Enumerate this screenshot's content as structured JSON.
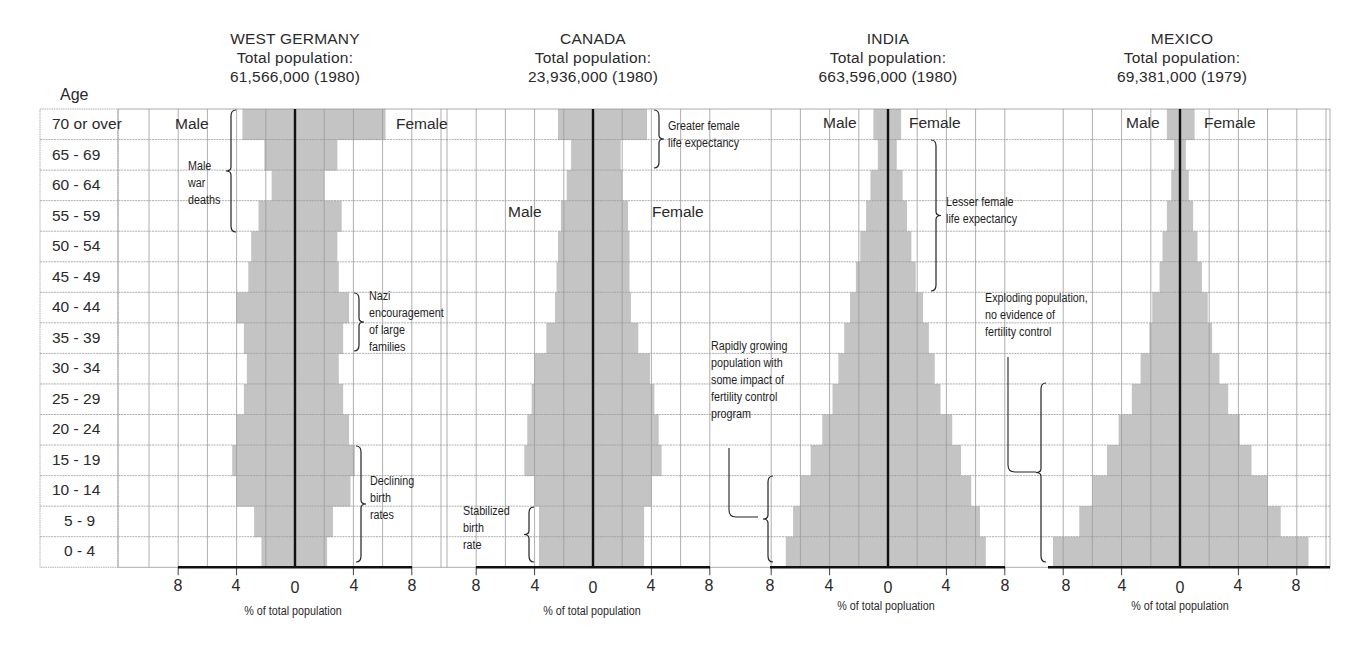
{
  "axis": {
    "age_header": "Age",
    "age_groups": [
      "70 or over",
      "65 - 69",
      "60 - 64",
      "55 - 59",
      "50 - 54",
      "45 - 49",
      "40 - 44",
      "35 - 39",
      "30 - 34",
      "25 - 29",
      "20 - 24",
      "15 - 19",
      "10 - 14",
      "5 - 9",
      "0 - 4"
    ],
    "tick_labels": [
      "8",
      "4",
      "0",
      "4",
      "8"
    ]
  },
  "panels": [
    {
      "country": "WEST GERMANY",
      "subtitle": "Total population:",
      "population": "61,566,000 (1980)",
      "xlabel": "% of total population",
      "male_label": "Male",
      "female_label": "Female",
      "annotations": [
        {
          "text": "Male\nwar\ndeaths"
        },
        {
          "text": "Nazi\nencouragement\nof large\nfamilies"
        },
        {
          "text": "Declining\nbirth\nrates"
        }
      ]
    },
    {
      "country": "CANADA",
      "subtitle": "Total population:",
      "population": "23,936,000 (1980)",
      "xlabel": "% of total population",
      "male_label": "Male",
      "female_label": "Female",
      "annotations": [
        {
          "text": "Greater female\nlife expectancy"
        },
        {
          "text": "Stabilized\nbirth\nrate"
        }
      ]
    },
    {
      "country": "INDIA",
      "subtitle": "Total population:",
      "population": "663,596,000 (1980)",
      "xlabel": "% of total popluation",
      "male_label": "Male",
      "female_label": "Female",
      "annotations": [
        {
          "text": "Lesser female\nlife expectancy"
        },
        {
          "text": "Rapidly growing\npopulation with\nsome impact of\nfertility control\nprogram"
        }
      ]
    },
    {
      "country": "MEXICO",
      "subtitle": "Total population:",
      "population": "69,381,000 (1979)",
      "xlabel": "% of total population",
      "male_label": "Male",
      "female_label": "Female",
      "annotations": [
        {
          "text": "Exploding population,\nno evidence of\nfertility control"
        }
      ]
    }
  ],
  "colors": {
    "bar": "#c4c4c4",
    "grid": "#9a9a9a",
    "axis": "#111111",
    "text": "#2a2a2a"
  },
  "chart_data": [
    {
      "type": "bar",
      "subtype": "population-pyramid",
      "title": "WEST GERMANY — Total population: 61,566,000 (1980)",
      "xlabel": "% of total population",
      "ylabel": "Age",
      "xlim": [
        -8,
        8
      ],
      "grid": true,
      "categories": [
        "70 or over",
        "65 - 69",
        "60 - 64",
        "55 - 59",
        "50 - 54",
        "45 - 49",
        "40 - 44",
        "35 - 39",
        "30 - 34",
        "25 - 29",
        "20 - 24",
        "15 - 19",
        "10 - 14",
        "5 - 9",
        "0 - 4"
      ],
      "series": [
        {
          "name": "Male",
          "values": [
            3.6,
            2.1,
            1.6,
            2.5,
            3.0,
            3.2,
            4.0,
            3.5,
            3.3,
            3.5,
            4.0,
            4.3,
            4.0,
            2.8,
            2.3
          ]
        },
        {
          "name": "Female",
          "values": [
            6.2,
            2.9,
            2.0,
            3.2,
            2.9,
            3.0,
            3.7,
            3.3,
            3.0,
            3.3,
            3.7,
            4.1,
            3.8,
            2.6,
            2.2
          ]
        }
      ],
      "annotations": [
        "Male war deaths (ages 55-70+)",
        "Nazi encouragement of large families (ages 35-44)",
        "Declining birth rates (ages 0-19)"
      ]
    },
    {
      "type": "bar",
      "subtype": "population-pyramid",
      "title": "CANADA — Total population: 23,936,000 (1980)",
      "xlabel": "% of total population",
      "ylabel": "Age",
      "xlim": [
        -8,
        8
      ],
      "grid": true,
      "categories": [
        "70 or over",
        "65 - 69",
        "60 - 64",
        "55 - 59",
        "50 - 54",
        "45 - 49",
        "40 - 44",
        "35 - 39",
        "30 - 34",
        "25 - 29",
        "20 - 24",
        "15 - 19",
        "10 - 14",
        "5 - 9",
        "0 - 4"
      ],
      "series": [
        {
          "name": "Male",
          "values": [
            2.4,
            1.5,
            1.8,
            2.2,
            2.4,
            2.5,
            2.6,
            3.2,
            4.0,
            4.2,
            4.5,
            4.7,
            4.0,
            3.7,
            3.7
          ]
        },
        {
          "name": "Female",
          "values": [
            3.7,
            1.9,
            2.0,
            2.4,
            2.5,
            2.5,
            2.6,
            3.1,
            3.9,
            4.2,
            4.5,
            4.7,
            4.0,
            3.5,
            3.5
          ]
        }
      ],
      "annotations": [
        "Greater female life expectancy (ages 65-70+)",
        "Stabilized birth rate (ages 0-9)"
      ]
    },
    {
      "type": "bar",
      "subtype": "population-pyramid",
      "title": "INDIA — Total population: 663,596,000 (1980)",
      "xlabel": "% of total popluation",
      "ylabel": "Age",
      "xlim": [
        -8,
        8
      ],
      "grid": true,
      "categories": [
        "70 or over",
        "65 - 69",
        "60 - 64",
        "55 - 59",
        "50 - 54",
        "45 - 49",
        "40 - 44",
        "35 - 39",
        "30 - 34",
        "25 - 29",
        "20 - 24",
        "15 - 19",
        "10 - 14",
        "5 - 9",
        "0 - 4"
      ],
      "series": [
        {
          "name": "Male",
          "values": [
            1.0,
            0.7,
            1.2,
            1.5,
            1.9,
            2.2,
            2.6,
            3.0,
            3.4,
            3.8,
            4.5,
            5.3,
            6.0,
            6.5,
            7.0
          ]
        },
        {
          "name": "Female",
          "values": [
            0.9,
            0.6,
            1.0,
            1.3,
            1.6,
            1.9,
            2.4,
            2.8,
            3.2,
            3.6,
            4.4,
            5.0,
            5.7,
            6.3,
            6.7
          ]
        }
      ],
      "annotations": [
        "Lesser female life expectancy (ages 45-69)",
        "Rapidly growing population with some impact of fertility control program (ages 0-14)"
      ]
    },
    {
      "type": "bar",
      "subtype": "population-pyramid",
      "title": "MEXICO — Total population: 69,381,000 (1979)",
      "xlabel": "% of total population",
      "ylabel": "Age",
      "xlim": [
        -8,
        8
      ],
      "grid": true,
      "categories": [
        "70 or over",
        "65 - 69",
        "60 - 64",
        "55 - 59",
        "50 - 54",
        "45 - 49",
        "40 - 44",
        "35 - 39",
        "30 - 34",
        "25 - 29",
        "20 - 24",
        "15 - 19",
        "10 - 14",
        "5 - 9",
        "0 - 4"
      ],
      "series": [
        {
          "name": "Male",
          "values": [
            0.9,
            0.4,
            0.6,
            0.9,
            1.2,
            1.4,
            1.9,
            2.1,
            2.7,
            3.3,
            4.2,
            5.0,
            6.0,
            6.9,
            8.7
          ]
        },
        {
          "name": "Female",
          "values": [
            1.0,
            0.4,
            0.6,
            0.9,
            1.2,
            1.5,
            1.9,
            2.2,
            2.7,
            3.3,
            4.1,
            4.9,
            6.0,
            6.9,
            8.8
          ]
        }
      ],
      "annotations": [
        "Exploding population, no evidence of fertility control (ages 0-29)"
      ]
    }
  ]
}
